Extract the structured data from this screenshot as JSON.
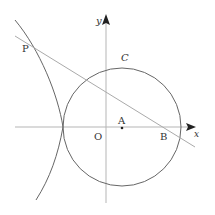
{
  "diagram": {
    "type": "coordinate-geometry",
    "labels": {
      "y_axis": "y",
      "x_axis": "x",
      "origin": "O",
      "circle": "C",
      "point_a": "A",
      "point_b": "B",
      "point_p": "P"
    },
    "elements": {
      "circle": {
        "name": "C",
        "center": "A",
        "tangent_to_curve_at": "x-axis left intersection"
      },
      "line": {
        "through": [
          "P",
          "B"
        ]
      },
      "curve": {
        "description": "left branch curve tangent to circle on x-axis, passing through P"
      }
    },
    "colors": {
      "axis": "#b0b0b0",
      "curve": "#555555",
      "line": "#a8a8a8",
      "text": "#333333"
    }
  }
}
